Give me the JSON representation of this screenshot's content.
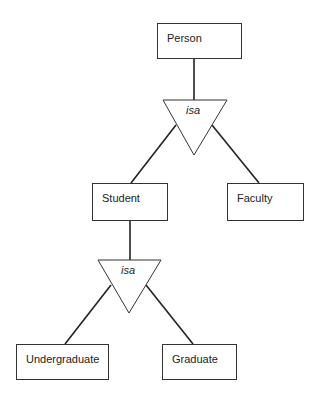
{
  "diagram": {
    "type": "ER generalization hierarchy",
    "entities": [
      {
        "id": "person",
        "label": "Person"
      },
      {
        "id": "student",
        "label": "Student"
      },
      {
        "id": "faculty",
        "label": "Faculty"
      },
      {
        "id": "undergraduate",
        "label": "Undergraduate"
      },
      {
        "id": "graduate",
        "label": "Graduate"
      }
    ],
    "isa_nodes": [
      {
        "id": "isa1",
        "label": "isa",
        "parent": "person",
        "children": [
          "student",
          "faculty"
        ]
      },
      {
        "id": "isa2",
        "label": "isa",
        "parent": "student",
        "children": [
          "undergraduate",
          "graduate"
        ]
      }
    ]
  }
}
